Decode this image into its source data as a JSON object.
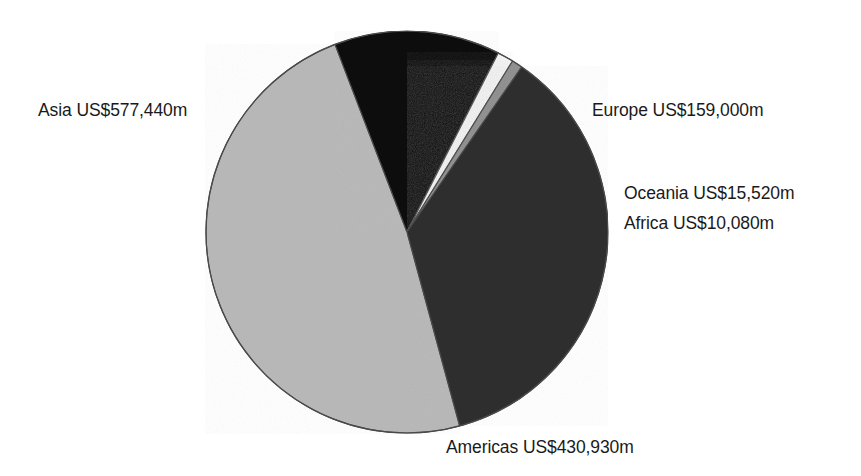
{
  "chart_data": {
    "type": "pie",
    "title": "",
    "subtitle": "",
    "units": "US$ millions",
    "currency_prefix": "US$",
    "value_suffix": "m",
    "total": 1192970,
    "grid": false,
    "legend_position": "outside-labels",
    "categories": [
      "Asia",
      "Americas",
      "Europe",
      "Oceania",
      "Africa"
    ],
    "values": [
      577440,
      430930,
      159000,
      15520,
      10080
    ],
    "value_text": [
      "577,440",
      "430,930",
      "159,000",
      "15,520",
      "10,080"
    ],
    "percentages": [
      48.4,
      36.1,
      13.3,
      1.3,
      0.8
    ],
    "colors": [
      "#b7b7b7",
      "#2e2e2e",
      "#0d0d0d",
      "#f2f2f2",
      "#8e8e8e"
    ],
    "slices": [
      {
        "name": "Asia",
        "label": "Asia US$577,440m",
        "value": 577440,
        "value_text": "577,440",
        "percent": 48.4,
        "color": "#b7b7b7",
        "start_angle": -21.0,
        "end_angle": -195.2,
        "label_position": "left"
      },
      {
        "name": "Europe",
        "label": "Europe US$159,000m",
        "value": 159000,
        "value_text": "159,000",
        "percent": 13.3,
        "color": "#0d0d0d",
        "start_angle": -21.0,
        "end_angle": 27.0,
        "label_position": "right-top"
      },
      {
        "name": "Oceania",
        "label": "Oceania US$15,520m",
        "value": 15520,
        "value_text": "15,520",
        "percent": 1.3,
        "color": "#f2f2f2",
        "start_angle": 27.0,
        "end_angle": 31.7,
        "label_position": "right-middle"
      },
      {
        "name": "Africa",
        "label": "Africa US$10,080m",
        "value": 10080,
        "value_text": "10,080",
        "percent": 0.8,
        "color": "#8e8e8e",
        "start_angle": 31.7,
        "end_angle": 34.8,
        "label_position": "right-lower"
      },
      {
        "name": "Americas",
        "label": "Americas US$430,930m",
        "value": 430930,
        "value_text": "430,930",
        "percent": 36.1,
        "color": "#2e2e2e",
        "start_angle": 34.8,
        "end_angle": 164.8,
        "label_position": "bottom"
      }
    ],
    "geometry": {
      "center_x": 407,
      "center_y": 232,
      "radius": 201,
      "stroke_color": "#4a4a4a",
      "stroke_width": 1.2,
      "background": "#ffffff"
    }
  },
  "labels": {
    "asia": "Asia US$577,440m",
    "europe": "Europe US$159,000m",
    "oceania": "Oceania US$15,520m",
    "africa": "Africa US$10,080m",
    "americas": "Americas US$430,930m"
  }
}
